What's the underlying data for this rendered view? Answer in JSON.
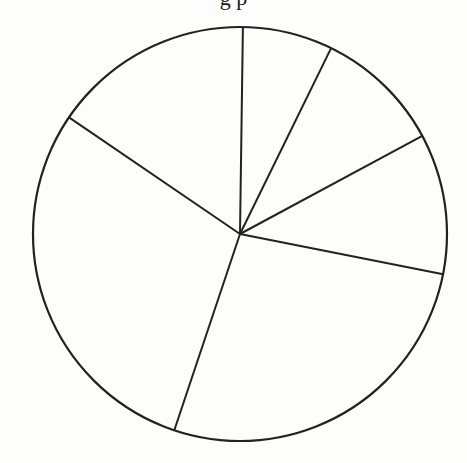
{
  "page": {
    "background": "#fdfdfc",
    "stroke_color": "#222222",
    "title_fragment": "g p"
  },
  "chart_data": {
    "type": "pie",
    "title": "",
    "title_note": "Title text cropped at top edge; only descenders visible",
    "labels": [
      "Slice 1",
      "Slice 2",
      "Slice 3",
      "Slice 4",
      "Slice 5",
      "Slice 6"
    ],
    "values": [
      7.0,
      9.9,
      11.0,
      27.0,
      29.4,
      15.7
    ],
    "units": "percent (estimated from wedge angles)",
    "start_angle_deg": 89.2,
    "direction": "clockwise",
    "slice_angles_deg": [
      25.3,
      35.6,
      39.5,
      97.3,
      105.8,
      56.5
    ],
    "fill": "none",
    "legend": null,
    "data_labels": null,
    "geometry": {
      "cx": 240,
      "cy": 234,
      "r": 207,
      "spoke_endpoints": [
        [
          243,
          28
        ],
        [
          330,
          50
        ],
        [
          422,
          136
        ],
        [
          442,
          274
        ],
        [
          174,
          428
        ],
        [
          70,
          118
        ]
      ]
    }
  }
}
